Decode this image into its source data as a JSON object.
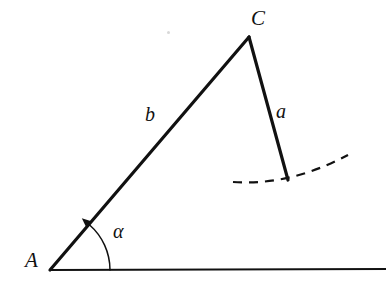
{
  "figure": {
    "type": "geometry-diagram",
    "background_color": "#ffffff",
    "stroke_color": "#111111",
    "labels": {
      "vertex_a": "A",
      "vertex_c": "C",
      "side_b": "b",
      "side_a": "a",
      "angle_alpha": "α"
    },
    "geometry": {
      "point_A": {
        "x": 50,
        "y": 270
      },
      "point_C": {
        "x": 249,
        "y": 37
      },
      "point_a_end": {
        "x": 288,
        "y": 180
      },
      "baseline": {
        "x1": 50,
        "y1": 270,
        "x2": 386,
        "y2": 269
      },
      "side_b": {
        "x1": 50,
        "y1": 270,
        "x2": 249,
        "y2": 37
      },
      "side_a": {
        "x1": 249,
        "y1": 37,
        "x2": 288,
        "y2": 180
      },
      "angle_arc": {
        "center_x": 50,
        "center_y": 270,
        "radius": 60,
        "start_angle_deg": 0,
        "end_angle_deg": 49,
        "arrow_at": "end"
      },
      "dashed_arc": {
        "x1": 233,
        "y1": 182,
        "x2": 348,
        "y2": 155,
        "control_x": 290,
        "control_y": 186,
        "dash_pattern": "9 7"
      },
      "speck": {
        "x": 167,
        "y": 31
      }
    },
    "stroke_widths": {
      "side": 3.2,
      "baseline": 2.2,
      "arc": 1.5,
      "dashed_arc": 2.2
    }
  }
}
